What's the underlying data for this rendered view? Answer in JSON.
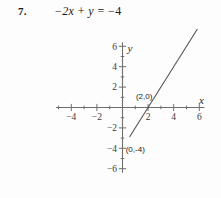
{
  "problem": {
    "number": "7.",
    "equation_parts": {
      "minus1": "−",
      "two_x": "2x",
      "plus": "+",
      "y": "y",
      "equals": "=",
      "minus2": "−",
      "four": "4"
    },
    "equation_text": "− 2x + y = − 4"
  },
  "chart_data": {
    "type": "line",
    "title": "",
    "xlabel": "x",
    "ylabel": "y",
    "xlim": [
      -5.2,
      6.4
    ],
    "ylim": [
      -6.4,
      6.4
    ],
    "grid": false,
    "axis_color": "#6f6f6f",
    "line_color": "#555555",
    "x_ticks_labeled": [
      -4,
      -2,
      2,
      4,
      6
    ],
    "x_tick_labels": [
      "−4",
      "−2",
      "2",
      "4",
      "6"
    ],
    "y_ticks_labeled": [
      6,
      4,
      2,
      -2,
      -4,
      -6
    ],
    "y_tick_labels": [
      "6",
      "4",
      "2",
      "−2",
      "−4",
      "−6"
    ],
    "x_minor_ticks": [
      -5,
      -4,
      -3,
      -2,
      -1,
      1,
      2,
      3,
      4,
      5,
      6
    ],
    "y_minor_ticks": [
      6,
      5,
      4,
      3,
      2,
      1,
      -1,
      -2,
      -3,
      -4,
      -5,
      -6
    ],
    "series": [
      {
        "name": "-2x + y = -4",
        "equation": "y = 2x - 4",
        "slope": 2,
        "intercept": -4,
        "x": [
          0.55,
          5.85
        ],
        "y": [
          -2.9,
          7.7
        ]
      }
    ],
    "annotations": [
      {
        "label": "(2,0)",
        "x": 2,
        "y": 0,
        "text_x": 1.05,
        "text_y": 0.85
      },
      {
        "label": "(0,-4)",
        "x": 0,
        "y": -4,
        "text_x": 0.25,
        "text_y": -4.35
      }
    ]
  }
}
